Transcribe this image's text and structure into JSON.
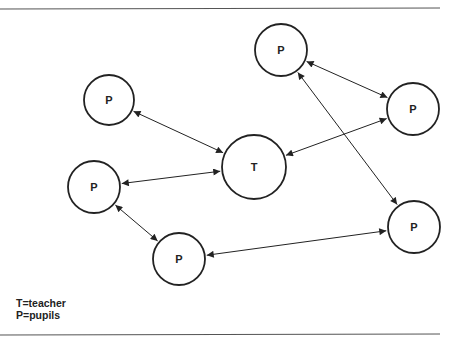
{
  "diagram": {
    "title": "",
    "nodes": [
      {
        "id": "p_top",
        "label": "P",
        "role": "pupil",
        "cx": 281,
        "cy": 50,
        "r": 26
      },
      {
        "id": "p_right",
        "label": "P",
        "role": "pupil",
        "cx": 413,
        "cy": 109,
        "r": 26
      },
      {
        "id": "p_topleft",
        "label": "P",
        "role": "pupil",
        "cx": 109,
        "cy": 100,
        "r": 25
      },
      {
        "id": "t",
        "label": "T",
        "role": "teacher",
        "cx": 254,
        "cy": 167,
        "r": 32
      },
      {
        "id": "p_left",
        "label": "P",
        "role": "pupil",
        "cx": 94,
        "cy": 187,
        "r": 26
      },
      {
        "id": "p_bottom",
        "label": "P",
        "role": "pupil",
        "cx": 179,
        "cy": 259,
        "r": 26
      },
      {
        "id": "p_bottomright",
        "label": "P",
        "role": "pupil",
        "cx": 414,
        "cy": 227,
        "r": 26
      }
    ],
    "edges": [
      {
        "from": "p_top",
        "to": "p_right",
        "bidirectional": true
      },
      {
        "from": "p_top",
        "to": "p_bottomright",
        "bidirectional": true
      },
      {
        "from": "p_topleft",
        "to": "t",
        "bidirectional": true
      },
      {
        "from": "p_right",
        "to": "t",
        "bidirectional": true
      },
      {
        "from": "p_left",
        "to": "t",
        "bidirectional": true
      },
      {
        "from": "p_left",
        "to": "p_bottom",
        "bidirectional": true
      },
      {
        "from": "p_bottom",
        "to": "p_bottomright",
        "bidirectional": true
      }
    ]
  },
  "legend": {
    "line1": "T=teacher",
    "line2": "P=pupils"
  },
  "colors": {
    "stroke": "#222222",
    "rule": "#555555",
    "background": "#ffffff"
  }
}
